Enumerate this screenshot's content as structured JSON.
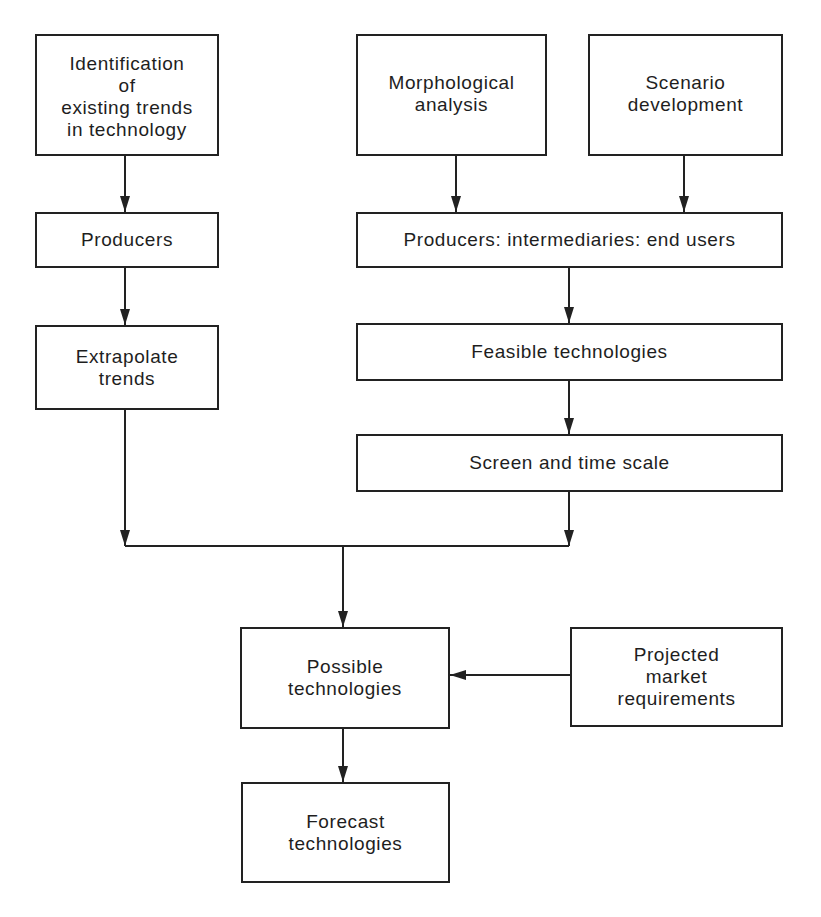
{
  "diagram": {
    "type": "flowchart",
    "nodes": {
      "identification": {
        "lines": [
          "Identification",
          "of",
          "existing trends",
          "in technology"
        ]
      },
      "morphological": {
        "lines": [
          "Morphological",
          "analysis"
        ]
      },
      "scenario": {
        "lines": [
          "Scenario",
          "development"
        ]
      },
      "producers": {
        "lines": [
          "Producers"
        ]
      },
      "producers_chain": {
        "lines": [
          "Producers: intermediaries: end users"
        ]
      },
      "extrapolate": {
        "lines": [
          "Extrapolate",
          "trends"
        ]
      },
      "feasible": {
        "lines": [
          "Feasible technologies"
        ]
      },
      "screen": {
        "lines": [
          "Screen and time scale"
        ]
      },
      "possible": {
        "lines": [
          "Possible",
          "technologies"
        ]
      },
      "projected": {
        "lines": [
          "Projected",
          "market",
          "requirements"
        ]
      },
      "forecast": {
        "lines": [
          "Forecast",
          "technologies"
        ]
      }
    },
    "edges": [
      {
        "from": "identification",
        "to": "producers"
      },
      {
        "from": "producers",
        "to": "extrapolate"
      },
      {
        "from": "morphological",
        "to": "producers_chain"
      },
      {
        "from": "scenario",
        "to": "producers_chain"
      },
      {
        "from": "producers_chain",
        "to": "feasible"
      },
      {
        "from": "feasible",
        "to": "screen"
      },
      {
        "from": "extrapolate",
        "to": "possible",
        "via": "merge-line"
      },
      {
        "from": "screen",
        "to": "possible",
        "via": "merge-line"
      },
      {
        "from": "projected",
        "to": "possible"
      },
      {
        "from": "possible",
        "to": "forecast"
      }
    ],
    "colors": {
      "line": "#222222",
      "background": "#ffffff",
      "text": "#1e1e1e"
    }
  }
}
